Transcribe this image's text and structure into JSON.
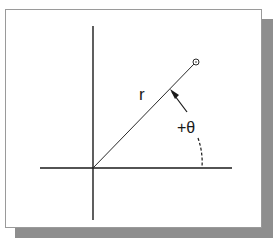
{
  "diagram": {
    "title": "",
    "labels": {
      "radius": "r",
      "angle": "+θ"
    },
    "colors": {
      "line": "#1a1a1a",
      "frame_border": "#9a9a9a",
      "shadow": "#8e8e8e",
      "background": "#ffffff"
    },
    "elements": {
      "x_axis": "horizontal axis",
      "y_axis": "vertical axis",
      "radius_line": "line from origin to point at angle θ",
      "point_marker": "small circle at end of radius",
      "angle_arc": "dashed arc indicating positive angle from x-axis",
      "angle_arrow": "leader arrow pointing to radius line"
    }
  }
}
